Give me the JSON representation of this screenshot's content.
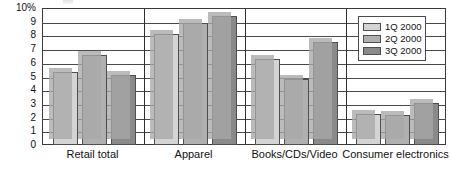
{
  "chart_data": {
    "type": "bar",
    "title": "",
    "subtitle": "",
    "xlabel": "",
    "ylabel": "",
    "ylim": [
      0,
      10
    ],
    "grid": true,
    "legend_position": "top-right",
    "categories": [
      "Retail total",
      "Apparel",
      "Books/CDs/Video",
      "Consumer electronics"
    ],
    "series": [
      {
        "name": "1Q 2000",
        "color": "#d4d4d4",
        "values": [
          5.3,
          8.1,
          6.3,
          2.3
        ]
      },
      {
        "name": "2Q 2000",
        "color": "#b0b0b0",
        "values": [
          6.6,
          8.9,
          4.8,
          2.2
        ]
      },
      {
        "name": "3Q 2000",
        "color": "#8a8a8a",
        "values": [
          5.1,
          9.4,
          7.5,
          3.1
        ]
      }
    ],
    "yticks": [
      "10%",
      "9",
      "8",
      "7",
      "6",
      "5",
      "4",
      "3",
      "2",
      "1",
      "0"
    ],
    "ytick_values": [
      10,
      9,
      8,
      7,
      6,
      5,
      4,
      3,
      2,
      1,
      0
    ]
  },
  "legend": {
    "items": [
      {
        "label": "1Q 2000"
      },
      {
        "label": "2Q 2000"
      },
      {
        "label": "3Q 2000"
      }
    ]
  },
  "colors": {
    "series1": "#d4d4d4",
    "series2": "#b0b0b0",
    "series3": "#8a8a8a",
    "shadow": "#a8a8a8",
    "axis": "#3a3a3a",
    "grid": "#4a4a4a",
    "text": "#111111"
  }
}
